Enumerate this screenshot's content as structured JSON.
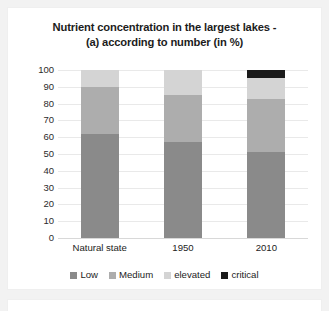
{
  "chart_data": {
    "type": "bar",
    "subtype": "stacked-column-100",
    "title": "Nutrient concentration in the largest lakes - (a) according to number (in %)",
    "title_lines": [
      "Nutrient concentration in the largest lakes -",
      "(a) according to number (in %)"
    ],
    "xlabel": "",
    "ylabel": "",
    "ylim": [
      0,
      100
    ],
    "yticks": [
      100,
      90,
      80,
      70,
      60,
      50,
      40,
      30,
      20,
      10,
      0
    ],
    "grid": true,
    "legend_position": "bottom",
    "categories": [
      "Natural state",
      "1950",
      "2010"
    ],
    "series": [
      {
        "name": "Low",
        "color": "#8a8a8a",
        "values": [
          62,
          57,
          51
        ]
      },
      {
        "name": "Medium",
        "color": "#adadad",
        "values": [
          28,
          28,
          32
        ]
      },
      {
        "name": "elevated",
        "color": "#d4d4d4",
        "values": [
          10,
          15,
          12
        ]
      },
      {
        "name": "critical",
        "color": "#1a1a1a",
        "values": [
          0,
          0,
          5
        ]
      }
    ]
  },
  "colors": {
    "low": "#8a8a8a",
    "medium": "#adadad",
    "elevated": "#d4d4d4",
    "critical": "#1a1a1a",
    "gridline": "#e9e9e9",
    "page_background": "#f2f2f2",
    "card_background": "#ffffff",
    "text": "#1c1c1c"
  }
}
